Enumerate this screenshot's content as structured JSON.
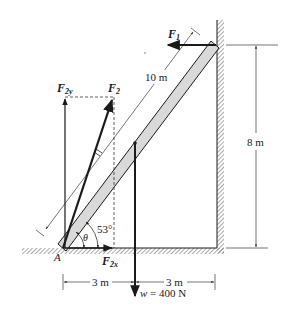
{
  "figure": {
    "type": "free-body diagram"
  },
  "labels": {
    "f1": "F",
    "f1_sub": "1",
    "f2": "F",
    "f2_sub": "2",
    "f2y": "F",
    "f2y_sub": "2y",
    "f2x": "F",
    "f2x_sub": "2x",
    "ladder_length": "10 m",
    "height": "8 m",
    "angle": "53°",
    "theta": "θ",
    "point_a": "A",
    "dist_left": "3 m",
    "dist_right": "3 m",
    "weight_var": "w",
    "weight_value": " = 400 N"
  },
  "values": {
    "ladder_length_m": 10,
    "wall_height_m": 8,
    "angle_deg": 53,
    "horizontal_left_m": 3,
    "horizontal_right_m": 3,
    "weight_N": 400
  },
  "colors": {
    "ink": "#1a1a1a",
    "ladder_fill": "#d9d9d9",
    "hatch": "#555555"
  }
}
